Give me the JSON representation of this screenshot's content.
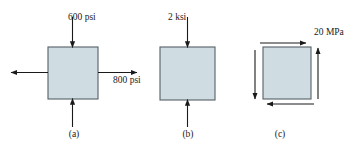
{
  "figure": {
    "background_color": "#ffffff",
    "box_fill_color": "#cfdde3",
    "box_stroke_color": "#555f66",
    "arrow_color": "#1a1a1a",
    "text_color": "#1a1a1a"
  },
  "elements": [
    {
      "id": "a",
      "caption": "(a)",
      "box": {
        "x": 48,
        "y": 47,
        "w": 50,
        "h": 52
      },
      "loads": [
        {
          "name": "top-compression",
          "label": "600 psi",
          "direction": "down",
          "value": 600,
          "unit": "psi"
        },
        {
          "name": "bottom-compression",
          "label": "",
          "direction": "up",
          "value": 600,
          "unit": "psi"
        },
        {
          "name": "right-tension",
          "label": "800 psi",
          "direction": "right",
          "value": 800,
          "unit": "psi"
        },
        {
          "name": "left-tension",
          "label": "",
          "direction": "left",
          "value": 800,
          "unit": "psi"
        }
      ]
    },
    {
      "id": "b",
      "caption": "(b)",
      "box": {
        "x": 160,
        "y": 47,
        "w": 55,
        "h": 53
      },
      "loads": [
        {
          "name": "top-compression",
          "label": "2 ksi",
          "direction": "down",
          "value": 2,
          "unit": "ksi"
        },
        {
          "name": "bottom-compression",
          "label": "",
          "direction": "up",
          "value": 2,
          "unit": "ksi"
        }
      ]
    },
    {
      "id": "c",
      "caption": "(c)",
      "box": {
        "x": 263,
        "y": 47,
        "w": 48,
        "h": 52
      },
      "loads": [
        {
          "name": "top-shear",
          "label": "20 MPa",
          "direction": "right",
          "value": 20,
          "unit": "MPa"
        },
        {
          "name": "bottom-shear",
          "label": "",
          "direction": "left",
          "value": 20,
          "unit": "MPa"
        },
        {
          "name": "left-shear",
          "label": "",
          "direction": "down",
          "value": 20,
          "unit": "MPa"
        },
        {
          "name": "right-shear",
          "label": "",
          "direction": "up",
          "value": 20,
          "unit": "MPa"
        }
      ]
    }
  ],
  "labels": {
    "stress_600_psi": "600 psi",
    "stress_800_psi": "800 psi",
    "stress_2_ksi": "2 ksi",
    "stress_20_mpa": "20 MPa",
    "caption_a": "(a)",
    "caption_b": "(b)",
    "caption_c": "(c)"
  }
}
